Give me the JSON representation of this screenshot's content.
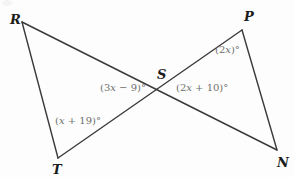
{
  "figure": {
    "background_color": "#fdfdfd",
    "line_color": "#3a3a3a",
    "line_width": 1.4,
    "vertex_label_color": "#1b1b1b",
    "angle_label_color": "#6e6e6e",
    "degree_symbol": "°"
  },
  "points": {
    "R": {
      "label": "R",
      "x": 22,
      "y": 22,
      "label_x": 10,
      "label_y": 13
    },
    "P": {
      "label": "P",
      "x": 242,
      "y": 30,
      "label_x": 244,
      "label_y": 10
    },
    "S": {
      "label": "S",
      "x": 163,
      "y": 90,
      "label_x": 157,
      "label_y": 68
    },
    "T": {
      "label": "T",
      "x": 58,
      "y": 158,
      "label_x": 52,
      "label_y": 163
    },
    "N": {
      "label": "N",
      "x": 277,
      "y": 150,
      "label_x": 277,
      "label_y": 156
    }
  },
  "segments": [
    {
      "name": "segment-R-N",
      "from": "R",
      "to": "N",
      "x1": 22,
      "y1": 22,
      "x2": 277,
      "y2": 150
    },
    {
      "name": "segment-P-T",
      "from": "P",
      "to": "T",
      "x1": 242,
      "y1": 30,
      "x2": 58,
      "y2": 158
    },
    {
      "name": "segment-R-T",
      "from": "R",
      "to": "T",
      "x1": 22,
      "y1": 22,
      "x2": 58,
      "y2": 158
    },
    {
      "name": "segment-P-N",
      "from": "P",
      "to": "N",
      "x1": 242,
      "y1": 30,
      "x2": 277,
      "y2": 150
    }
  ],
  "angle_labels": [
    {
      "name": "angle-RST",
      "text": "(3x − 9)°",
      "prefix": "(3",
      "variable": "x",
      "suffix": " − 9)°",
      "x": 100,
      "y": 83,
      "at_vertex": "S"
    },
    {
      "name": "angle-PSN",
      "text": "(2x + 10)°",
      "prefix": "(2",
      "variable": "x",
      "suffix": " + 10)°",
      "x": 176,
      "y": 83,
      "at_vertex": "S"
    },
    {
      "name": "angle-P",
      "text": "(2x)°",
      "prefix": "(2",
      "variable": "x",
      "suffix": ")°",
      "x": 215,
      "y": 45,
      "at_vertex": "P"
    },
    {
      "name": "angle-T",
      "text": "(x + 19)°",
      "prefix": "(",
      "variable": "x",
      "suffix": " + 19)°",
      "x": 55,
      "y": 116,
      "at_vertex": "T"
    }
  ]
}
